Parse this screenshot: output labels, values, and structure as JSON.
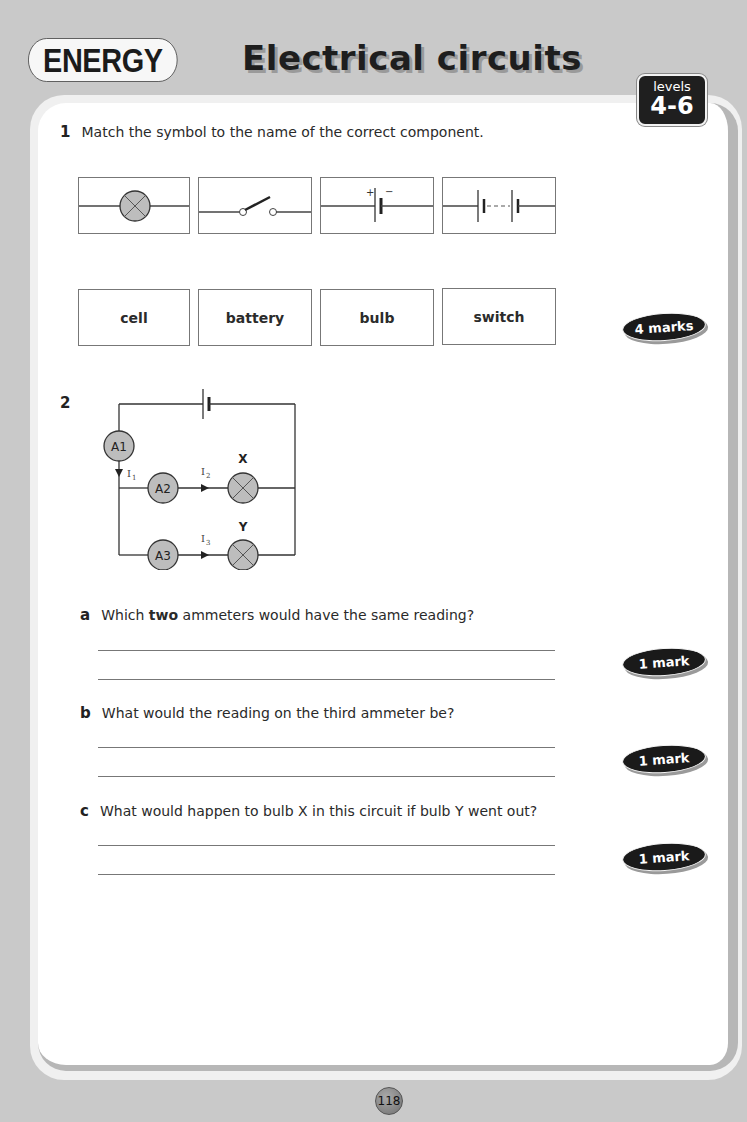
{
  "header": {
    "topic": "ENERGY",
    "title": "Electrical circuits",
    "levels_label": "levels",
    "levels_range": "4-6"
  },
  "question1": {
    "number": "1",
    "prompt": "Match the symbol to the name of the correct component.",
    "symbols": [
      {
        "icon": "bulb-symbol-icon"
      },
      {
        "icon": "open-switch-symbol-icon"
      },
      {
        "icon": "cell-symbol-icon",
        "plus": "+",
        "minus": "−"
      },
      {
        "icon": "battery-symbol-icon"
      }
    ],
    "names": [
      "cell",
      "battery",
      "bulb",
      "switch"
    ],
    "marks": "4 marks"
  },
  "question2": {
    "number": "2",
    "diagram": {
      "ammeters": [
        "A1",
        "A2",
        "A3"
      ],
      "bulbs": [
        "X",
        "Y"
      ],
      "currents": [
        "I1",
        "I2",
        "I3"
      ]
    },
    "parts": [
      {
        "label": "a",
        "text_before": "Which ",
        "text_bold": "two",
        "text_after": " ammeters would have the same reading?",
        "marks": "1 mark"
      },
      {
        "label": "b",
        "text": "What would the reading on the third ammeter be?",
        "marks": "1 mark"
      },
      {
        "label": "c",
        "text": "What would happen to bulb X in this circuit if bulb Y went out?",
        "marks": "1 mark"
      }
    ]
  },
  "footer": {
    "page_number": "118"
  },
  "colors": {
    "background": "#c9c9c9",
    "panel": "#ffffff",
    "badge": "#1a1a1a",
    "component_fill": "#bdbdbd"
  }
}
